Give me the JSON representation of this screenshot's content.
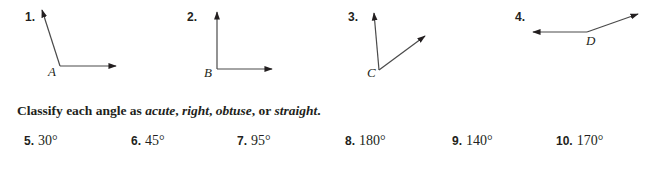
{
  "figures": [
    {
      "number": "1.",
      "vertex_label": "A",
      "vertex": [
        60,
        66
      ],
      "rays": [
        [
          42,
          10
        ],
        [
          116,
          66
        ]
      ]
    },
    {
      "number": "2.",
      "vertex_label": "B",
      "vertex": [
        217,
        69
      ],
      "rays": [
        [
          217,
          12
        ],
        [
          272,
          69
        ]
      ]
    },
    {
      "number": "3.",
      "vertex_label": "C",
      "vertex": [
        379,
        70
      ],
      "rays": [
        [
          374,
          13
        ],
        [
          425,
          36
        ]
      ]
    },
    {
      "number": "4.",
      "vertex_label": "D",
      "vertex": [
        587,
        32
      ],
      "rays": [
        [
          533,
          32
        ],
        [
          638,
          14
        ]
      ]
    }
  ],
  "instruction": {
    "prefix": "Classify each angle as ",
    "term1": "acute",
    "sep1": ", ",
    "term2": "right",
    "sep2": ", ",
    "term3": "obtuse",
    "sep3": ", or ",
    "term4": "straight",
    "suffix": "."
  },
  "exercises": [
    {
      "number": "5.",
      "value": "30°"
    },
    {
      "number": "6.",
      "value": "45°"
    },
    {
      "number": "7.",
      "value": "95°"
    },
    {
      "number": "8.",
      "value": "180°"
    },
    {
      "number": "9.",
      "value": "140°"
    },
    {
      "number": "10.",
      "value": "170°"
    }
  ],
  "colors": {
    "ink": "#231f20",
    "line": "#4a4a4a",
    "background": "#ffffff"
  }
}
